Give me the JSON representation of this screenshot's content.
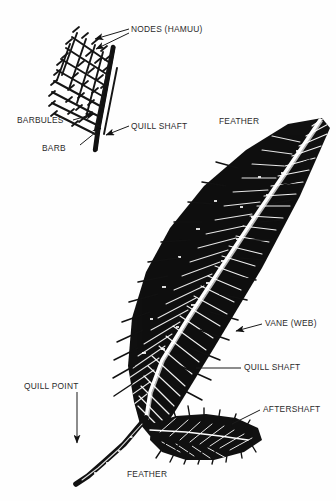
{
  "figure": {
    "background_color": "#fefefe",
    "ink_color": "#111111",
    "label_color": "#2b2b2b",
    "labels": {
      "nodes": "NODES (HAMUU)",
      "barbules": "BARBULES",
      "barb": "BARB",
      "quill_shaft_detail": "QUILL SHAFT",
      "feather_top": "FEATHER",
      "vane": "VANE (WEB)",
      "quill_shaft_main": "QUILL SHAFT",
      "aftershaft": "AFTERSHAFT",
      "quill_point": "QUILL POINT",
      "feather_bottom": "FEATHER"
    },
    "detail_inset": {
      "name": "barbule-mesh-detail",
      "description": "crosshatched barbule lattice hooked onto a diagonal quill shaft",
      "mesh_rows": 9,
      "mesh_cols": 7
    },
    "main_feather": {
      "name": "whole-feather",
      "description": "dense black contour feather with white rachis, tip upper-right, quill point lower-left, aftershaft plume at base"
    },
    "leaders": [
      {
        "name": "nodes-leader-upper",
        "style": "arrow"
      },
      {
        "name": "nodes-leader-lower",
        "style": "arrow"
      },
      {
        "name": "barbules-leader",
        "style": "arrow"
      },
      {
        "name": "barb-leader",
        "style": "arrow"
      },
      {
        "name": "quill-shaft-detail-leader",
        "style": "arrow"
      },
      {
        "name": "vane-leader",
        "style": "arrow"
      },
      {
        "name": "quill-shaft-main-leader",
        "style": "line"
      },
      {
        "name": "aftershaft-leader",
        "style": "line"
      },
      {
        "name": "quill-point-leader",
        "style": "arrow"
      }
    ]
  }
}
